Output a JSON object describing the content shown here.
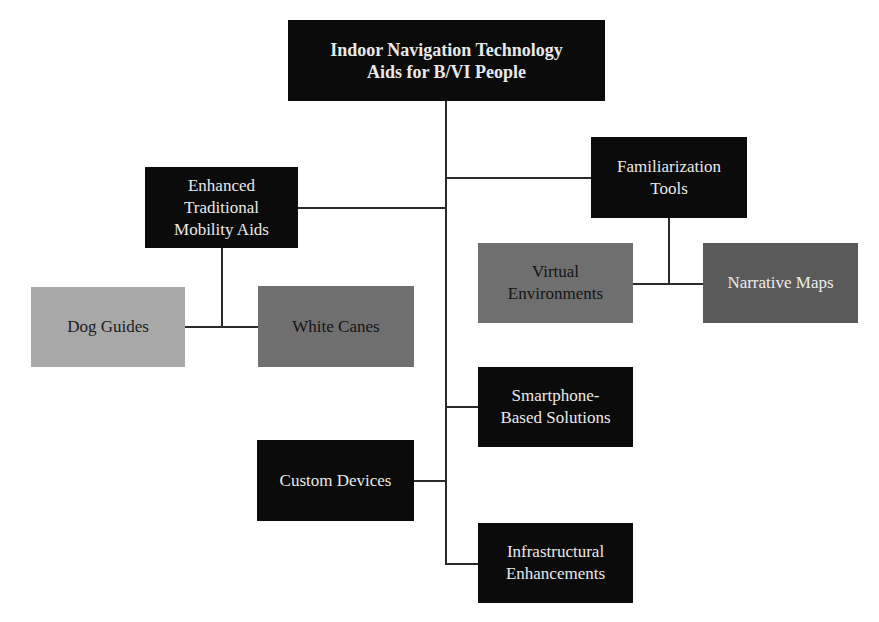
{
  "diagram": {
    "root": {
      "label": "Indoor Navigation Technology Aids for B/VI People",
      "line1": "Indoor Navigation Technology",
      "line2": "Aids for B/VI People"
    },
    "nodes": {
      "enhanced": {
        "label": "Enhanced Traditional Mobility Aids",
        "line1": "Enhanced",
        "line2": "Traditional",
        "line3": "Mobility Aids"
      },
      "familiarization": {
        "label": "Familiarization Tools",
        "line1": "Familiarization",
        "line2": "Tools"
      },
      "dog_guides": {
        "label": "Dog Guides"
      },
      "white_canes": {
        "label": "White Canes"
      },
      "virtual_env": {
        "label": "Virtual Environments",
        "line1": "Virtual",
        "line2": "Environments"
      },
      "narrative_maps": {
        "label": "Narrative Maps"
      },
      "smartphone": {
        "label": "Smartphone-Based Solutions",
        "line1": "Smartphone-",
        "line2": "Based Solutions"
      },
      "custom_devices": {
        "label": "Custom Devices"
      },
      "infrastructural": {
        "label": "Infrastructural Enhancements",
        "line1": "Infrastructural",
        "line2": "Enhancements"
      }
    },
    "edges": [
      [
        "root",
        "enhanced"
      ],
      [
        "root",
        "familiarization"
      ],
      [
        "root",
        "smartphone"
      ],
      [
        "root",
        "custom_devices"
      ],
      [
        "root",
        "infrastructural"
      ],
      [
        "enhanced",
        "dog_guides"
      ],
      [
        "enhanced",
        "white_canes"
      ],
      [
        "familiarization",
        "virtual_env"
      ],
      [
        "familiarization",
        "narrative_maps"
      ]
    ],
    "colors": {
      "dark": "#0b0b0b",
      "mid_gray": "#6f6f6f",
      "dark_gray": "#5a5a5a",
      "light_gray": "#a8a8a8",
      "line": "#2a2a2a"
    }
  }
}
